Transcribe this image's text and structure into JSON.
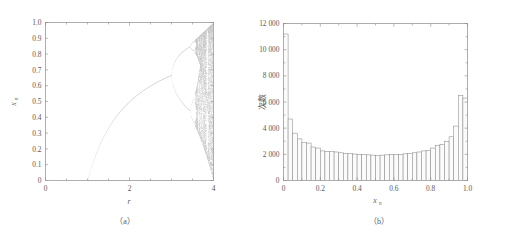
{
  "figure": {
    "background": "#ffffff",
    "ink_color": "#5a5a5a",
    "axis_color": "#8a8a8a",
    "bar_fill": "#fbfbfb",
    "bar_stroke": "#8d8d8d",
    "point_color": "#b4b4b4"
  },
  "panel_a": {
    "caption": "（a）",
    "xlabel": "r",
    "ylabel_base": "x",
    "ylabel_sub": "n",
    "x_ticks": [
      "0",
      "2",
      "4"
    ],
    "x_tick_values": [
      0,
      2,
      4
    ],
    "x_minor_count": 8,
    "y_ticks": [
      "0",
      "0.1",
      "0.2",
      "0.3",
      "0.4",
      "0.5",
      "0.6",
      "0.7",
      "0.8",
      "0.9",
      "1.0"
    ],
    "y_tick_values": [
      0,
      0.1,
      0.2,
      0.3,
      0.4,
      0.5,
      0.6,
      0.7,
      0.8,
      0.9,
      1.0
    ]
  },
  "panel_b": {
    "caption": "（b）",
    "xlabel_base": "x",
    "xlabel_sub": "n",
    "ylabel": "次数",
    "x_ticks": [
      "0",
      "0.2",
      "0.4",
      "0.6",
      "0.8",
      "1.0"
    ],
    "x_tick_values": [
      0,
      0.2,
      0.4,
      0.6,
      0.8,
      1.0
    ],
    "y_ticks": [
      "0",
      "2 000",
      "4 000",
      "6 000",
      "8 000",
      "10 000",
      "12 000"
    ],
    "y_tick_values": [
      0,
      2000,
      4000,
      6000,
      8000,
      10000,
      12000
    ]
  },
  "chart_data": [
    {
      "type": "scatter",
      "title": "",
      "panel": "(a)",
      "xlabel": "r",
      "ylabel": "x_n",
      "xlim": [
        0,
        4
      ],
      "ylim": [
        0,
        1.0
      ],
      "grid": false,
      "legend": null,
      "description": "Logistic map bifurcation diagram: x_{n+1} = r*x_n*(1-x_n). Fixed point 0 for r<1, rises as (r-1)/r to r=3, period doubling to chaos at r~3.57, chaotic band widening up to r=4.",
      "series": [
        {
          "name": "bifurcation",
          "equation": "x_{n+1} = r x_n (1 - x_n)",
          "r_start": 0,
          "r_end": 4,
          "fixed_point_branch": "x = (r-1)/r for 1 <= r <= 3",
          "first_bifurcation_r": 3.0,
          "second_bifurcation_r": 3.449,
          "third_bifurcation_r": 3.544,
          "chaos_onset_r": 3.5699,
          "branch_at_r3": 0.6667,
          "period3_window_r": 3.828
        }
      ]
    },
    {
      "type": "bar",
      "panel": "(b)",
      "title": "",
      "xlabel": "x_n",
      "ylabel": "次数",
      "xlim": [
        0,
        1.0
      ],
      "ylim": [
        0,
        12000
      ],
      "grid": false,
      "legend": null,
      "bin_width": 0.025,
      "description": "Histogram of logistic map iterates at r=4; invariant density 1/(pi*sqrt(x(1-x))) gives U-shape with tall edge bins.",
      "categories": [
        "0.0125",
        "0.0375",
        "0.0625",
        "0.0875",
        "0.1125",
        "0.1375",
        "0.1625",
        "0.1875",
        "0.2125",
        "0.2375",
        "0.2625",
        "0.2875",
        "0.3125",
        "0.3375",
        "0.3625",
        "0.3875",
        "0.4125",
        "0.4375",
        "0.4625",
        "0.4875",
        "0.5125",
        "0.5375",
        "0.5625",
        "0.5875",
        "0.6125",
        "0.6375",
        "0.6625",
        "0.6875",
        "0.7125",
        "0.7375",
        "0.7625",
        "0.7875",
        "0.8125",
        "0.8375",
        "0.8625",
        "0.8875",
        "0.9125",
        "0.9375",
        "0.9625",
        "0.9875"
      ],
      "values": [
        11200,
        4700,
        3620,
        3180,
        2900,
        2860,
        2560,
        2480,
        2260,
        2220,
        2200,
        2180,
        2120,
        2080,
        2060,
        2020,
        2000,
        1980,
        1960,
        1940,
        1920,
        1940,
        1960,
        1980,
        2000,
        2000,
        2040,
        2080,
        2120,
        2180,
        2260,
        2300,
        2480,
        2660,
        2760,
        3000,
        3340,
        4160,
        6500,
        6300
      ]
    }
  ]
}
